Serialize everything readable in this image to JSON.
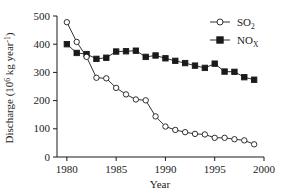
{
  "chart_data": {
    "type": "line",
    "title": "",
    "xlabel": "Year",
    "ylabel": "Discharge (10^6 kg year^-1)",
    "ylabel_parts": {
      "main": "Discharge (10",
      "exp1": "6",
      "mid": " kg year",
      "exp2": "-1",
      "close": ")"
    },
    "xlim": [
      1979,
      2000
    ],
    "ylim": [
      0,
      500
    ],
    "xticks": [
      1980,
      1985,
      1990,
      1995,
      2000
    ],
    "xtick_labels": [
      "1980",
      "1985",
      "1990",
      "1995",
      "2000"
    ],
    "yticks": [
      0,
      100,
      200,
      300,
      400,
      500
    ],
    "ytick_labels": [
      "0",
      "100",
      "200",
      "300",
      "400",
      "500"
    ],
    "grid": false,
    "legend_position": "top-right",
    "x": [
      1980,
      1981,
      1982,
      1983,
      1984,
      1985,
      1986,
      1987,
      1988,
      1989,
      1990,
      1991,
      1992,
      1993,
      1994,
      1995,
      1996,
      1997,
      1998,
      1999
    ],
    "series": [
      {
        "name": "SO2",
        "name_main": "SO",
        "name_sub": "2",
        "marker": "open-circle",
        "color": "#1a1a1a",
        "fill": "#ffffff",
        "values": [
          478,
          408,
          355,
          281,
          279,
          245,
          222,
          204,
          201,
          144,
          108,
          96,
          88,
          82,
          80,
          68,
          68,
          63,
          59,
          45
        ]
      },
      {
        "name": "NOX",
        "name_main": "NO",
        "name_sub": "X",
        "marker": "filled-square",
        "color": "#1a1a1a",
        "fill": "#1a1a1a",
        "values": [
          400,
          369,
          365,
          348,
          352,
          374,
          375,
          377,
          355,
          360,
          350,
          341,
          333,
          324,
          316,
          331,
          303,
          302,
          283,
          274
        ]
      }
    ],
    "last_nox_point": 252
  },
  "legend": {
    "items": [
      {
        "label_main": "SO",
        "label_sub": "2",
        "marker": "open-circle"
      },
      {
        "label_main": "NO",
        "label_sub": "X",
        "marker": "filled-square"
      }
    ]
  }
}
